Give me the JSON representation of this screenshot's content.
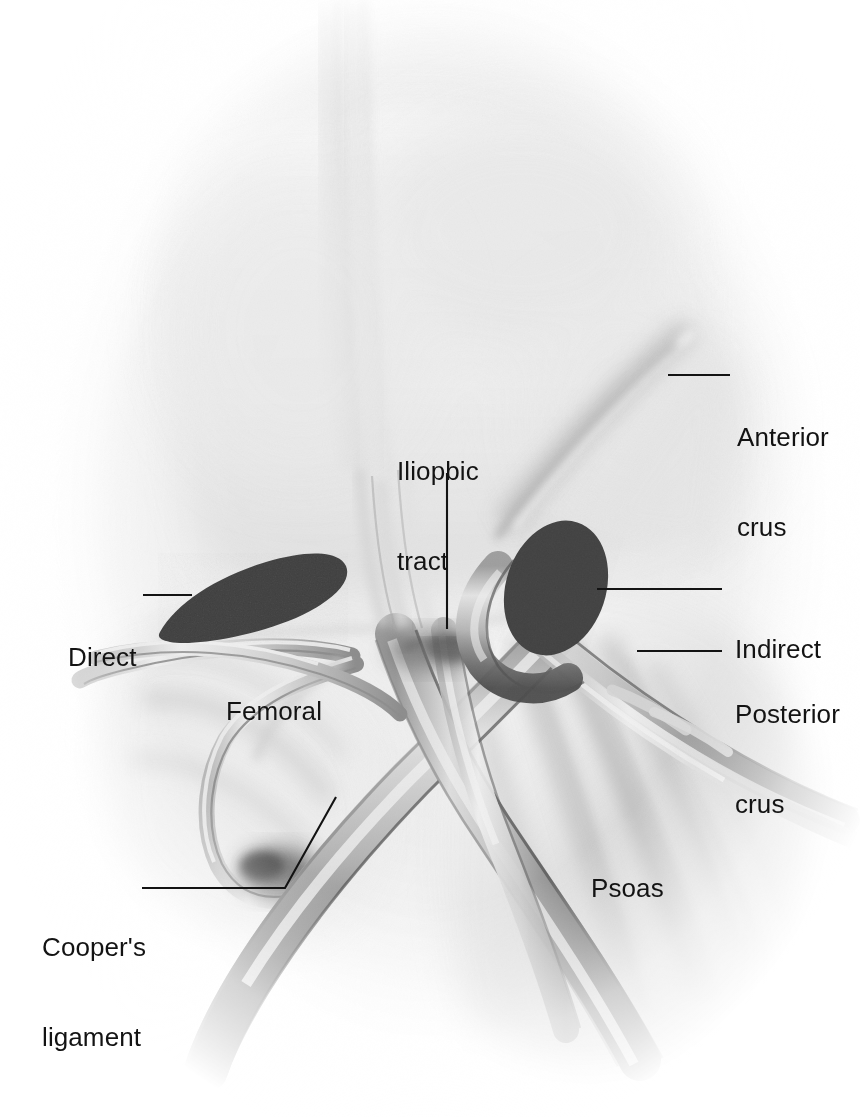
{
  "figure": {
    "kind": "anatomical-illustration",
    "style": "grayscale airbrush medical illustration",
    "background_color": "#ffffff",
    "ink_color": "#131313",
    "defect_fill": "#3f3f3f",
    "width": 860,
    "height": 1117
  },
  "labels": [
    {
      "id": "anterior-crus",
      "text": "Anterior\ncrus",
      "line1": "Anterior",
      "line2": "crus",
      "x": 737,
      "y": 362,
      "align": "left",
      "leader": {
        "type": "straight",
        "x1": 668,
        "y1": 375,
        "x2": 730,
        "y2": 375
      }
    },
    {
      "id": "iliopubic-tract",
      "text": "Iliopbic\ntract",
      "line1": "Iliopbic",
      "line2": "tract",
      "x": 397,
      "y": 396,
      "align": "left",
      "leader": {
        "type": "straight",
        "x1": 447,
        "y1": 473,
        "x2": 447,
        "y2": 629
      }
    },
    {
      "id": "direct",
      "text": "Direct",
      "line1": "Direct",
      "line2": "",
      "x": 68,
      "y": 582,
      "align": "left",
      "leader": {
        "type": "straight",
        "x1": 143,
        "y1": 595,
        "x2": 192,
        "y2": 595
      }
    },
    {
      "id": "indirect",
      "text": "Indirect",
      "line1": "Indirect",
      "line2": "",
      "x": 735,
      "y": 574,
      "align": "left",
      "leader": {
        "type": "straight",
        "x1": 597,
        "y1": 589,
        "x2": 722,
        "y2": 589
      }
    },
    {
      "id": "posterior-crus",
      "text": "Posterior\ncrus",
      "line1": "Posterior",
      "line2": "crus",
      "x": 735,
      "y": 639,
      "align": "left",
      "leader": {
        "type": "straight",
        "x1": 637,
        "y1": 651,
        "x2": 722,
        "y2": 651
      }
    },
    {
      "id": "femoral",
      "text": "Femoral",
      "line1": "Femoral",
      "line2": "",
      "x": 226,
      "y": 636,
      "align": "left",
      "leader": null
    },
    {
      "id": "psoas",
      "text": "Psoas",
      "line1": "Psoas",
      "line2": "",
      "x": 591,
      "y": 813,
      "align": "left",
      "leader": null
    },
    {
      "id": "coopers-ligament",
      "text": "Cooper's\nligament",
      "line1": "Cooper's",
      "line2": "ligament",
      "x": 42,
      "y": 872,
      "align": "left",
      "leader": {
        "type": "elbow",
        "x1": 142,
        "y1": 888,
        "x2": 285,
        "y2": 888,
        "x3": 336,
        "y3": 797
      }
    }
  ],
  "hernia_defects": [
    {
      "id": "direct-defect",
      "shape": "teardrop",
      "cx": 252,
      "cy": 592,
      "rx": 96,
      "ry": 38,
      "rotation": -17
    },
    {
      "id": "indirect-defect",
      "shape": "ellipse",
      "cx": 556,
      "cy": 588,
      "rx": 50,
      "ry": 68,
      "rotation": 18
    }
  ],
  "anatomy_structures": [
    {
      "id": "psoas-muscle",
      "name": "Psoas major muscle",
      "region": "right-lower"
    },
    {
      "id": "iliac-vessels",
      "name": "External iliac artery and vein",
      "region": "center"
    },
    {
      "id": "inferior-epigastric-vessels",
      "name": "Inferior epigastric vessels",
      "region": "left-center"
    },
    {
      "id": "spermatic-cord",
      "name": "Spermatic cord / vas deferens",
      "region": "upper-center"
    },
    {
      "id": "transversalis-fascia",
      "name": "Transversalis fascia sheet",
      "region": "upper"
    },
    {
      "id": "iliopubic-tract-band",
      "name": "Iliopubic tract",
      "region": "center"
    },
    {
      "id": "coopers-ligament-structure",
      "name": "Cooper's (pectineal) ligament",
      "region": "lower-left"
    },
    {
      "id": "anterior-crus-band",
      "name": "Anterior crus of internal ring",
      "region": "upper-right"
    },
    {
      "id": "posterior-crus-band",
      "name": "Posterior crus of internal ring",
      "region": "right"
    }
  ]
}
